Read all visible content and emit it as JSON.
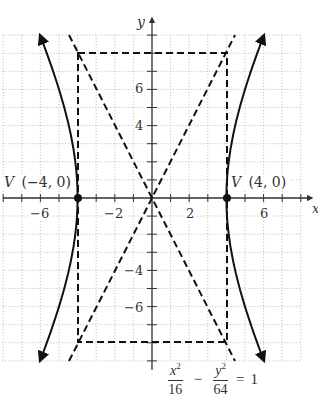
{
  "chart_data": {
    "type": "line",
    "xlabel": "x",
    "ylabel": "y",
    "xlim": [
      -8,
      8
    ],
    "ylim": [
      -9,
      9
    ],
    "grid": true,
    "x_tick_labels": [
      "-6",
      "-2",
      "2",
      "6"
    ],
    "y_tick_labels": [
      "6",
      "4",
      "-4",
      "-6"
    ],
    "vertices": [
      {
        "label": "V (-4, 0)",
        "x": -4,
        "y": 0
      },
      {
        "label": "V (4, 0)",
        "x": 4,
        "y": 0
      }
    ],
    "asymptotes": [
      "y = 2x",
      "y = -2x"
    ],
    "fundamental_rectangle": {
      "x_min": -4,
      "x_max": 4,
      "y_min": -8,
      "y_max": 8
    },
    "series": [
      {
        "name": "right branch",
        "x": [
          6.02,
          5.0,
          4.47,
          4.12,
          4.0,
          4.12,
          4.47,
          5.0,
          6.02
        ],
        "y": [
          9,
          6,
          4,
          2,
          0,
          -2,
          -4,
          -6,
          -9
        ]
      },
      {
        "name": "left branch",
        "x": [
          -6.02,
          -5.0,
          -4.47,
          -4.12,
          -4.0,
          -4.12,
          -4.47,
          -5.0,
          -6.02
        ],
        "y": [
          9,
          6,
          4,
          2,
          0,
          -2,
          -4,
          -6,
          -9
        ]
      }
    ]
  },
  "labels": {
    "y_axis": "y",
    "x_axis": "x",
    "vertex_left": "V (−4, 0)",
    "vertex_right": "V (4, 0)",
    "ticks_x": [
      "−6",
      "−2",
      "2",
      "6"
    ],
    "ticks_y": [
      "6",
      "4",
      "−4",
      "−6"
    ]
  },
  "equation": {
    "num1": "x",
    "den1": "16",
    "num2": "y",
    "den2": "64",
    "exp": "2",
    "minus": "−",
    "equals": "=",
    "rhs": "1"
  }
}
